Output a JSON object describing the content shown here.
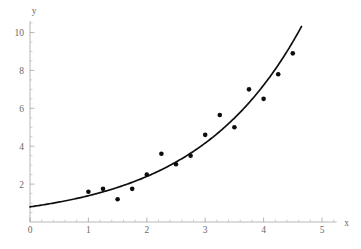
{
  "chart_data": {
    "type": "scatter",
    "title": "",
    "subtitle": "",
    "xlabel": "x",
    "ylabel": "y",
    "xlim": [
      0,
      5.25
    ],
    "ylim": [
      0,
      10.6
    ],
    "grid": false,
    "legend": null,
    "x_ticks": [
      0,
      1,
      2,
      3,
      4,
      5
    ],
    "x_tick_labels": [
      "0",
      "1",
      "2",
      "3",
      "4",
      "5"
    ],
    "x_minor_step": 0.2,
    "y_ticks": [
      2,
      4,
      6,
      8,
      10
    ],
    "y_tick_labels": [
      "2",
      "4",
      "6",
      "8",
      "10"
    ],
    "y_minor_step": 0.5,
    "point_color": "#0d0d0d",
    "curve_color": "#101010",
    "axis_color": "#9a9a9a",
    "series": [
      {
        "name": "data",
        "type": "scatter",
        "x": [
          1.0,
          1.25,
          1.5,
          1.75,
          2.0,
          2.25,
          2.5,
          2.75,
          3.0,
          3.25,
          3.5,
          3.75,
          4.0,
          4.25,
          4.5
        ],
        "y": [
          1.6,
          1.75,
          1.2,
          1.75,
          2.5,
          3.6,
          3.05,
          3.5,
          4.6,
          5.65,
          5.0,
          7.0,
          6.5,
          7.8,
          8.9
        ]
      },
      {
        "name": "fit",
        "type": "line",
        "model": "exponential",
        "a": 0.8,
        "b": 0.55,
        "x_start": 0,
        "x_end": 4.65
      }
    ]
  },
  "axis_labels": {
    "x": "x",
    "y": "y"
  }
}
